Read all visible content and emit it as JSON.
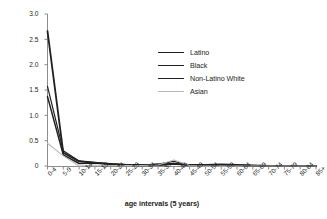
{
  "figure": {
    "top_partial_text": "",
    "background": "#ffffff"
  },
  "chart_data": {
    "type": "line",
    "title": "",
    "xlabel": "age intervals (5 years)",
    "ylabel": "age-specific incidence rate",
    "categories": [
      "0-4",
      "5-9",
      "10-14",
      "15-19",
      "20-24",
      "25-29",
      "30-34",
      "35-39",
      "40-44",
      "45-49",
      "50-54",
      "55-59",
      "60-64",
      "65-69",
      "70-74",
      "75-79",
      "80-84",
      "85+"
    ],
    "ylim": [
      0,
      3.0
    ],
    "yticks": [
      "0",
      "0.5",
      "1.0",
      "1.5",
      "2.0",
      "2.5",
      "3.0"
    ],
    "ytick_values": [
      0,
      0.5,
      1.0,
      1.5,
      2.0,
      2.5,
      3.0
    ],
    "grid": false,
    "legend_position": "upper-center-right",
    "series": [
      {
        "name": "Latino",
        "color": "#231f20",
        "width": 1.5,
        "values": [
          1.37,
          0.22,
          0.05,
          0.06,
          0.03,
          0.02,
          0.01,
          0.02,
          0.05,
          0.02,
          0.02,
          0.02,
          0.01,
          0.0,
          0.0,
          0.0,
          0.0,
          0.0
        ]
      },
      {
        "name": "Black",
        "color": "#231f20",
        "width": 1.2,
        "values": [
          1.57,
          0.3,
          0.1,
          0.07,
          0.04,
          0.03,
          0.02,
          0.04,
          0.09,
          0.02,
          0.02,
          0.03,
          0.02,
          0.01,
          0.0,
          0.0,
          0.0,
          0.0
        ]
      },
      {
        "name": "Non-Latino White",
        "color": "#231f20",
        "width": 1.8,
        "values": [
          2.66,
          0.26,
          0.09,
          0.06,
          0.04,
          0.02,
          0.02,
          0.02,
          0.04,
          0.02,
          0.02,
          0.03,
          0.02,
          0.01,
          0.0,
          0.0,
          0.0,
          0.0
        ]
      },
      {
        "name": "Asian",
        "color": "#b9b9b9",
        "width": 1.1,
        "values": [
          0.45,
          0.2,
          0.0,
          0.02,
          0.01,
          0.01,
          0.01,
          0.02,
          0.12,
          0.01,
          0.0,
          0.0,
          0.0,
          0.0,
          0.0,
          0.0,
          0.0,
          0.0
        ]
      }
    ]
  },
  "axes": {
    "axis_color": "#8c8c8c",
    "tick_color": "#8c8c8c"
  }
}
